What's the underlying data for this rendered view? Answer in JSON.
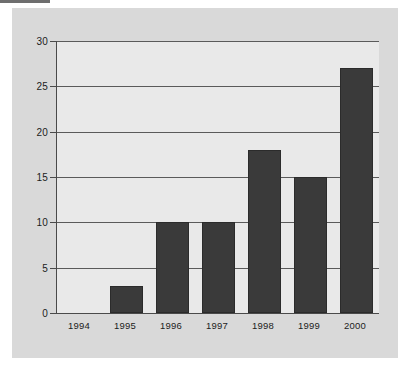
{
  "chart_data": {
    "type": "bar",
    "title": "",
    "subtitle": "",
    "xlabel": "",
    "ylabel": "",
    "categories": [
      "1994",
      "1995",
      "1996",
      "1997",
      "1998",
      "1999",
      "2000"
    ],
    "values": [
      0,
      3,
      10,
      10,
      18,
      15,
      27
    ],
    "series": [
      {
        "name": "",
        "values": [
          0,
          3,
          10,
          10,
          18,
          15,
          27
        ]
      }
    ],
    "ylim": [
      0,
      30
    ],
    "y_ticks": [
      0,
      5,
      10,
      15,
      20,
      25,
      30
    ],
    "y_tick_labels": [
      "0",
      "5",
      "10",
      "15",
      "20",
      "25",
      "30"
    ],
    "grid": true,
    "grid_axis": "y",
    "legend": false,
    "legend_position": "none",
    "annotations": []
  },
  "style": {
    "panel_background": "#d9d9d9",
    "plot_background": "#e9e9e9",
    "bar_color": "#3a3a3a",
    "bar_border_color": "#2b2b2b",
    "gridline_color": "#5a5a5a",
    "axis_color": "#4a4a4a",
    "text_color": "#1c1c1c",
    "page_background": "#ffffff"
  }
}
